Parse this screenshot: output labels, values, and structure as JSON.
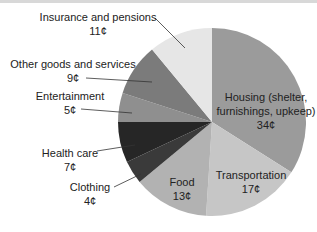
{
  "chart_data": {
    "type": "pie",
    "title": "",
    "unit": "¢",
    "start_angle_deg": 0,
    "direction": "clockwise",
    "categories": [
      "Housing (shelter, furnishings, upkeep)",
      "Transportation",
      "Food",
      "Clothing",
      "Health care",
      "Entertainment",
      "Other goods and services",
      "Insurance and pensions"
    ],
    "values": [
      34,
      17,
      13,
      4,
      7,
      5,
      9,
      11
    ],
    "colors": [
      "#9b9b9b",
      "#c6c6c6",
      "#b2b2b2",
      "#3a3a3a",
      "#262626",
      "#8f8f8f",
      "#7b7b7b",
      "#e6e6e6"
    ]
  },
  "labels": {
    "housing": {
      "name_line1": "Housing (shelter,",
      "name_line2": "furnishings, upkeep)",
      "value": "34¢"
    },
    "transportation": {
      "name": "Transportation",
      "value": "17¢"
    },
    "food": {
      "name": "Food",
      "value": "13¢"
    },
    "clothing": {
      "name": "Clothing",
      "value": "4¢"
    },
    "health": {
      "name": "Health care",
      "value": "7¢"
    },
    "entertainment": {
      "name": "Entertainment",
      "value": "5¢"
    },
    "other": {
      "name": "Other goods and services",
      "value": "9¢"
    },
    "insurance": {
      "name": "Insurance and pensions",
      "value": "11¢"
    }
  }
}
